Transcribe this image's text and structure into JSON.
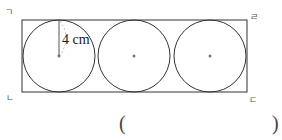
{
  "figure": {
    "corner_labels": {
      "top_left": "ㄱ",
      "top_right": "ㄹ",
      "bottom_left": "ㄴ",
      "bottom_right": "ㄷ"
    },
    "radius_label": "4 cm",
    "circle_count": 3,
    "colors": {
      "stroke": "#333333",
      "center_dot": "#777777",
      "radius_line": "#555555",
      "dashed_arc": "#aaaaaa"
    }
  },
  "answer": {
    "open_paren": "(",
    "close_paren": ")",
    "value": ""
  }
}
